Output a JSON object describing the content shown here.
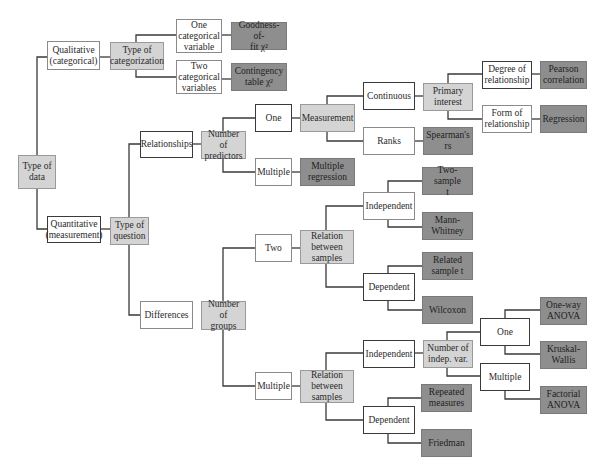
{
  "diagram": {
    "colors": {
      "decision": "#d4d4d4",
      "option": "#ffffff",
      "test": "#8e8e8e",
      "line": "#3a3a3a"
    },
    "nodes": {
      "type_of_data": "Type of\ndata",
      "qualitative": "Qualitative\n(categorical)",
      "type_of_categorization": "Type of\ncategorization",
      "one_categorical": "One\ncategorical\nvariable",
      "two_categorical": "Two\ncategorical\nvariables",
      "goodness_of_fit": "Goodness-of-\nfit χ²",
      "contingency_table": "Contingency\ntable χ²",
      "quantitative": "Quantitative\n(measurement)",
      "type_of_question": "Type of\nquestion",
      "relationships": "Relationships",
      "number_of_predictors": "Number of\npredictors",
      "pred_one": "One",
      "pred_multiple": "Multiple",
      "multiple_regression": "Multiple\nregression",
      "measurement": "Measurement",
      "continuous": "Continuous",
      "ranks": "Ranks",
      "spearman": "Spearman's\nrs",
      "primary_interest": "Primary\ninterest",
      "degree_of_relationship": "Degree of\nrelationship",
      "form_of_relationship": "Form of\nrelationship",
      "pearson": "Pearson\ncorrelation",
      "regression": "Regression",
      "differences": "Differences",
      "number_of_groups": "Number of\ngroups",
      "groups_two": "Two",
      "groups_multiple": "Multiple",
      "relation_two": "Relation\nbetween\nsamples",
      "relation_multiple": "Relation\nbetween\nsamples",
      "two_independent": "Independent",
      "two_dependent": "Dependent",
      "two_sample_t": "Two-sample\nt",
      "mann_whitney": "Mann-\nWhitney",
      "related_sample_t": "Related\nsample t",
      "wilcoxon": "Wilcoxon",
      "multi_independent": "Independent",
      "multi_dependent": "Dependent",
      "number_indep_var": "Number of\nindep. var.",
      "indep_one": "One",
      "indep_multiple": "Multiple",
      "one_way_anova": "One-way\nANOVA",
      "kruskal_wallis": "Kruskal-\nWallis",
      "factorial_anova": "Factorial\nANOVA",
      "repeated_measures": "Repeated\nmeasures",
      "friedman": "Friedman"
    }
  }
}
